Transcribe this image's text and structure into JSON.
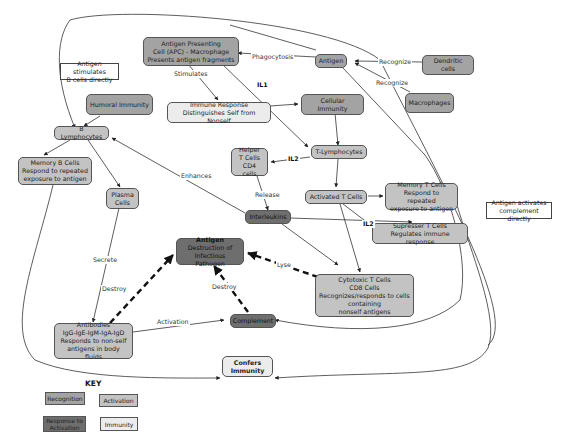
{
  "colors": {
    "recognition": "#a3a3a3",
    "activation": "#c3c3c3",
    "response_to_activation": "#6e6e6e",
    "immunity": "#ececec",
    "line": "#333333"
  },
  "nodes": {
    "apc": {
      "text": "Antigen Presenting\nCell (APC) - Macrophage\nPresents antigen fragments",
      "type": "recognition"
    },
    "antigen_top": {
      "text": "Antigen",
      "type": "recognition"
    },
    "dendritic": {
      "text": "Dendritic cells",
      "type": "recognition"
    },
    "macrophages": {
      "text": "Macrophages",
      "type": "recognition"
    },
    "humoral": {
      "text": "Humoral Immunity",
      "type": "recognition"
    },
    "immune_response": {
      "text": "Immune Response\nDistinguishes Self from Nonself",
      "type": "immunity"
    },
    "cellular": {
      "text": "Cellular Immunity",
      "type": "recognition"
    },
    "b_lymph": {
      "text": "B Lymphocytes",
      "type": "activation"
    },
    "t_lymph": {
      "text": "T-Lymphocytes",
      "type": "activation"
    },
    "helper": {
      "text": "Helper\nT Cells\nCD4 cells",
      "type": "activation"
    },
    "memory_b": {
      "text": "Memory B Cells\nRespond to repeated\nexposure to antigen",
      "type": "activation"
    },
    "plasma": {
      "text": "Plasma\nCells",
      "type": "activation"
    },
    "activated_t": {
      "text": "Activated T Cells",
      "type": "activation"
    },
    "memory_t": {
      "text": "Memory T Cells\nRespond to repeated\nexposure to antigen",
      "type": "activation"
    },
    "interleukins": {
      "text": "Interleukins",
      "type": "response"
    },
    "supresser": {
      "text": "Supresser T Cells\nRegulates immune response",
      "type": "activation"
    },
    "antigen_destruction_title": {
      "text": "Antigen",
      "type": "response"
    },
    "antigen_destruction": {
      "text": "Destruction of\nInfectious Pathogen",
      "type": "response"
    },
    "cytotoxic": {
      "text": "Cytotoxic T Cells\nCD8 Cells\nRecognizes/responds to cells\ncontaining\nnonself antigens",
      "type": "activation"
    },
    "antibodies": {
      "text": "Antibodies\nIgG-IgE-IgM-IgA-IgD\nResponds to non-self\nantigens in body fluids",
      "type": "activation"
    },
    "complement": {
      "text": "Complement",
      "type": "response"
    },
    "confers": {
      "text": "Confers\nImmunity",
      "type": "immunity"
    },
    "note_b_direct": {
      "text": "Antigen stimulates\nB cells directly",
      "type": "note"
    },
    "note_complement": {
      "text": "Antigen activates\ncomplement directly",
      "type": "note"
    }
  },
  "edge_labels": {
    "phagocytosis": "Phagocytosis",
    "recognize_1": "Recognize",
    "recognize_2": "Recognize",
    "stimulates": "Stimulates",
    "il1": "IL1",
    "il2_helper": "IL2",
    "il2_supresser": "IL2",
    "release": "Release",
    "enhances": "Enhances",
    "secrete": "Secrete",
    "destroy_antibodies": "Destroy",
    "destroy_complement": "Destroy",
    "lyse": "Lyse",
    "activation": "Activation"
  },
  "key": {
    "title": "KEY",
    "items": [
      {
        "label": "Recognition",
        "type": "recognition"
      },
      {
        "label": "Activation",
        "type": "activation"
      },
      {
        "label": "Response to\nActivation",
        "type": "response"
      },
      {
        "label": "Immunity",
        "type": "immunity"
      }
    ]
  }
}
